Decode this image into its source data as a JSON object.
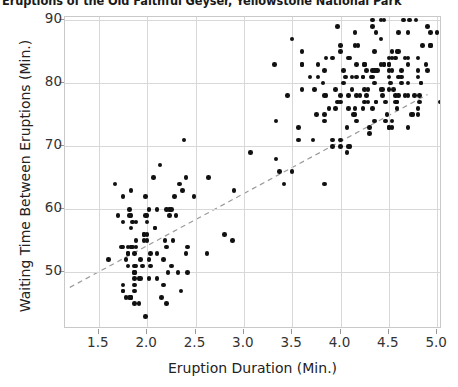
{
  "chart_data": {
    "type": "scatter",
    "title": "Eruptions of the Old Faithful Geyser, Yellowstone National Park",
    "xlabel": "Eruption Duration (Min.)",
    "ylabel": "Waiting Time Between Eruptions (Min.)",
    "xlim": [
      1.15,
      5.05
    ],
    "ylim": [
      41.0,
      90.5
    ],
    "xticks": [
      "1.5",
      "2.0",
      "2.5",
      "3.0",
      "3.5",
      "4.0",
      "4.5",
      "5.0"
    ],
    "xtick_values": [
      1.5,
      2.0,
      2.5,
      3.0,
      3.5,
      4.0,
      4.5,
      5.0
    ],
    "yticks": [
      "50",
      "60",
      "70",
      "80",
      "90"
    ],
    "ytick_values": [
      50,
      60,
      70,
      80,
      90
    ],
    "grid": true,
    "legend": "none",
    "marker_color": "#111111",
    "grid_color": "#d8d8d8",
    "frame_color": "#c9c9c9",
    "trendline": {
      "style": "dashed",
      "color": "#9a9a9a",
      "x_start": 1.2,
      "y_start": 47.6,
      "x_end": 4.9,
      "y_end": 78.2
    },
    "points": [
      [
        3.6,
        79
      ],
      [
        1.8,
        54
      ],
      [
        3.333,
        74
      ],
      [
        2.283,
        62
      ],
      [
        4.533,
        85
      ],
      [
        2.883,
        55
      ],
      [
        4.7,
        88
      ],
      [
        3.6,
        85
      ],
      [
        1.95,
        51
      ],
      [
        4.35,
        85
      ],
      [
        1.833,
        54
      ],
      [
        3.917,
        84
      ],
      [
        4.2,
        78
      ],
      [
        1.75,
        47
      ],
      [
        4.7,
        83
      ],
      [
        2.167,
        52
      ],
      [
        1.75,
        62
      ],
      [
        4.8,
        84
      ],
      [
        1.6,
        52
      ],
      [
        4.25,
        79
      ],
      [
        1.8,
        51
      ],
      [
        1.75,
        47
      ],
      [
        3.45,
        78
      ],
      [
        3.067,
        69
      ],
      [
        4.533,
        74
      ],
      [
        3.6,
        83
      ],
      [
        1.967,
        55
      ],
      [
        4.083,
        76
      ],
      [
        3.85,
        78
      ],
      [
        4.433,
        79
      ],
      [
        4.3,
        73
      ],
      [
        4.467,
        77
      ],
      [
        3.367,
        66
      ],
      [
        4.033,
        80
      ],
      [
        3.833,
        74
      ],
      [
        2.017,
        52
      ],
      [
        1.867,
        48
      ],
      [
        4.833,
        80
      ],
      [
        1.833,
        59
      ],
      [
        4.783,
        90
      ],
      [
        4.35,
        80
      ],
      [
        1.883,
        58
      ],
      [
        4.567,
        84
      ],
      [
        1.75,
        58
      ],
      [
        4.533,
        73
      ],
      [
        3.317,
        83
      ],
      [
        3.833,
        64
      ],
      [
        2.1,
        53
      ],
      [
        4.633,
        82
      ],
      [
        2.0,
        59
      ],
      [
        4.8,
        75
      ],
      [
        4.716,
        90
      ],
      [
        1.833,
        54
      ],
      [
        4.833,
        80
      ],
      [
        1.733,
        54
      ],
      [
        4.883,
        83
      ],
      [
        3.717,
        71
      ],
      [
        1.667,
        64
      ],
      [
        4.567,
        77
      ],
      [
        4.317,
        81
      ],
      [
        2.233,
        59
      ],
      [
        4.5,
        84
      ],
      [
        1.75,
        48
      ],
      [
        4.8,
        82
      ],
      [
        1.817,
        60
      ],
      [
        4.4,
        92
      ],
      [
        4.167,
        78
      ],
      [
        4.7,
        78
      ],
      [
        2.067,
        65
      ],
      [
        4.7,
        73
      ],
      [
        4.033,
        82
      ],
      [
        1.967,
        56
      ],
      [
        4.5,
        79
      ],
      [
        4.0,
        71
      ],
      [
        1.983,
        62
      ],
      [
        5.067,
        76
      ],
      [
        2.017,
        60
      ],
      [
        4.567,
        78
      ],
      [
        3.883,
        76
      ],
      [
        3.6,
        83
      ],
      [
        4.133,
        75
      ],
      [
        4.333,
        82
      ],
      [
        4.1,
        70
      ],
      [
        2.633,
        65
      ],
      [
        4.067,
        73
      ],
      [
        4.933,
        88
      ],
      [
        3.95,
        76
      ],
      [
        4.517,
        80
      ],
      [
        2.167,
        48
      ],
      [
        4.0,
        86
      ],
      [
        2.2,
        60
      ],
      [
        4.333,
        90
      ],
      [
        1.867,
        50
      ],
      [
        4.817,
        78
      ],
      [
        1.833,
        63
      ],
      [
        4.3,
        72
      ],
      [
        4.667,
        84
      ],
      [
        3.75,
        75
      ],
      [
        1.867,
        51
      ],
      [
        4.9,
        82
      ],
      [
        2.483,
        62
      ],
      [
        4.367,
        88
      ],
      [
        2.1,
        49
      ],
      [
        4.5,
        83
      ],
      [
        4.05,
        81
      ],
      [
        1.867,
        47
      ],
      [
        4.7,
        84
      ],
      [
        1.783,
        52
      ],
      [
        4.85,
        86
      ],
      [
        3.683,
        81
      ],
      [
        4.733,
        75
      ],
      [
        2.3,
        59
      ],
      [
        4.9,
        89
      ],
      [
        4.417,
        79
      ],
      [
        1.7,
        59
      ],
      [
        4.633,
        81
      ],
      [
        2.317,
        50
      ],
      [
        4.6,
        85
      ],
      [
        1.817,
        59
      ],
      [
        4.417,
        87
      ],
      [
        2.617,
        53
      ],
      [
        4.067,
        69
      ],
      [
        4.25,
        77
      ],
      [
        1.967,
        56
      ],
      [
        4.6,
        88
      ],
      [
        3.767,
        81
      ],
      [
        1.917,
        45
      ],
      [
        4.5,
        82
      ],
      [
        2.267,
        55
      ],
      [
        4.65,
        90
      ],
      [
        1.867,
        45
      ],
      [
        4.167,
        83
      ],
      [
        2.8,
        56
      ],
      [
        4.333,
        89
      ],
      [
        1.833,
        46
      ],
      [
        4.383,
        82
      ],
      [
        1.883,
        51
      ],
      [
        4.933,
        86
      ],
      [
        2.033,
        53
      ],
      [
        3.733,
        79
      ],
      [
        4.233,
        81
      ],
      [
        2.233,
        60
      ],
      [
        4.533,
        82
      ],
      [
        4.817,
        77
      ],
      [
        4.333,
        76
      ],
      [
        1.983,
        59
      ],
      [
        4.633,
        80
      ],
      [
        2.017,
        49
      ],
      [
        5.1,
        96
      ],
      [
        1.8,
        53
      ],
      [
        5.033,
        77
      ],
      [
        4.0,
        77
      ],
      [
        2.4,
        65
      ],
      [
        4.6,
        81
      ],
      [
        3.567,
        71
      ],
      [
        4.0,
        70
      ],
      [
        4.5,
        81
      ],
      [
        4.083,
        93
      ],
      [
        1.8,
        53
      ],
      [
        3.967,
        89
      ],
      [
        2.2,
        45
      ],
      [
        4.15,
        86
      ],
      [
        2.0,
        58
      ],
      [
        3.833,
        78
      ],
      [
        3.5,
        66
      ],
      [
        4.583,
        76
      ],
      [
        2.367,
        63
      ],
      [
        5.0,
        88
      ],
      [
        1.933,
        52
      ],
      [
        4.617,
        93
      ],
      [
        1.917,
        49
      ],
      [
        2.083,
        57
      ],
      [
        4.583,
        77
      ],
      [
        3.333,
        68
      ],
      [
        4.167,
        81
      ],
      [
        4.333,
        81
      ],
      [
        4.5,
        73
      ],
      [
        2.417,
        50
      ],
      [
        4.0,
        85
      ],
      [
        4.167,
        74
      ],
      [
        1.883,
        55
      ],
      [
        4.583,
        77
      ],
      [
        4.25,
        83
      ],
      [
        3.767,
        83
      ],
      [
        2.033,
        51
      ],
      [
        4.433,
        78
      ],
      [
        4.083,
        84
      ],
      [
        1.833,
        46
      ],
      [
        4.417,
        83
      ],
      [
        2.183,
        55
      ],
      [
        4.8,
        81
      ],
      [
        1.833,
        57
      ],
      [
        4.8,
        76
      ],
      [
        4.1,
        84
      ],
      [
        3.966,
        77
      ],
      [
        4.233,
        81
      ],
      [
        3.5,
        87
      ],
      [
        4.366,
        77
      ],
      [
        2.25,
        51
      ],
      [
        4.667,
        78
      ],
      [
        2.1,
        60
      ],
      [
        4.35,
        82
      ],
      [
        4.133,
        91
      ],
      [
        1.867,
        53
      ],
      [
        4.6,
        78
      ],
      [
        1.783,
        46
      ],
      [
        4.367,
        77
      ],
      [
        3.85,
        84
      ],
      [
        1.933,
        49
      ],
      [
        4.5,
        83
      ],
      [
        2.383,
        71
      ],
      [
        4.7,
        80
      ],
      [
        1.867,
        49
      ],
      [
        3.833,
        75
      ],
      [
        3.417,
        64
      ],
      [
        4.233,
        76
      ],
      [
        2.4,
        53
      ],
      [
        4.8,
        94
      ],
      [
        2.0,
        55
      ],
      [
        4.15,
        76
      ],
      [
        1.867,
        50
      ],
      [
        4.267,
        82
      ],
      [
        1.75,
        54
      ],
      [
        4.483,
        75
      ],
      [
        4.0,
        78
      ],
      [
        4.117,
        79
      ],
      [
        4.083,
        78
      ],
      [
        4.267,
        78
      ],
      [
        3.917,
        70
      ],
      [
        4.55,
        79
      ],
      [
        4.083,
        70
      ],
      [
        2.417,
        54
      ],
      [
        4.183,
        86
      ],
      [
        2.217,
        50
      ],
      [
        4.45,
        90
      ],
      [
        1.883,
        54
      ],
      [
        1.85,
        54
      ],
      [
        4.283,
        77
      ],
      [
        3.95,
        79
      ],
      [
        2.333,
        64
      ],
      [
        4.15,
        75
      ],
      [
        2.35,
        47
      ],
      [
        4.933,
        86
      ],
      [
        2.9,
        63
      ],
      [
        4.583,
        85
      ],
      [
        3.833,
        82
      ],
      [
        2.083,
        57
      ],
      [
        4.367,
        82
      ],
      [
        2.133,
        67
      ],
      [
        4.35,
        74
      ],
      [
        2.2,
        54
      ],
      [
        4.45,
        83
      ],
      [
        3.567,
        73
      ],
      [
        4.5,
        73
      ],
      [
        4.15,
        88
      ],
      [
        3.817,
        80
      ],
      [
        3.917,
        71
      ],
      [
        4.45,
        83
      ],
      [
        2.0,
        56
      ],
      [
        4.283,
        79
      ],
      [
        4.767,
        78
      ],
      [
        4.533,
        84
      ],
      [
        1.85,
        58
      ],
      [
        4.25,
        83
      ],
      [
        1.983,
        43
      ],
      [
        2.25,
        60
      ],
      [
        4.75,
        75
      ],
      [
        4.117,
        81
      ],
      [
        2.15,
        46
      ],
      [
        4.417,
        90
      ],
      [
        1.817,
        46
      ],
      [
        4.467,
        74
      ]
    ]
  }
}
